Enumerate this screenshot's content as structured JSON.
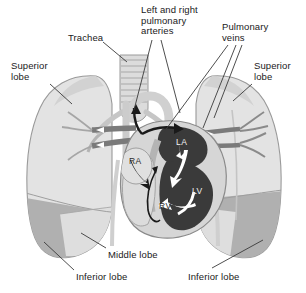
{
  "figure": {
    "background_color": "#ffffff",
    "palette": {
      "lung_light": "#e3e3e3",
      "lung_mid": "#d2d2d2",
      "inferior_lobe_gray": "#b0b0b0",
      "vessel_gray": "#9a9a9a",
      "vessel_dark": "#6f6f6f",
      "heart_chamber_dark": "#3a3a3a",
      "heart_muscle": "#c8c8c8",
      "outline": "#8a8a8a",
      "leader_line": "#3a3a3a",
      "text": "#1a1a1a"
    }
  },
  "labels": [
    {
      "id": "trachea",
      "text": "Trachea",
      "x": 68,
      "y": 33,
      "align": "left"
    },
    {
      "id": "pulmonary-arteries",
      "text": "Left and right\npulmonary\narteries",
      "x": 141,
      "y": 5,
      "align": "left"
    },
    {
      "id": "pulmonary-veins",
      "text": "Pulmonary\nveins",
      "x": 222,
      "y": 22,
      "align": "left"
    },
    {
      "id": "superior-lobe-left",
      "text": "Superior\nlobe",
      "x": 11,
      "y": 61,
      "align": "left"
    },
    {
      "id": "superior-lobe-right",
      "text": "Superior\nlobe",
      "x": 254,
      "y": 61,
      "align": "left"
    },
    {
      "id": "middle-lobe",
      "text": "Middle lobe",
      "x": 108,
      "y": 250,
      "align": "left"
    },
    {
      "id": "inferior-lobe-left",
      "text": "Inferior lobe",
      "x": 76,
      "y": 272,
      "align": "left"
    },
    {
      "id": "inferior-lobe-right",
      "text": "Inferior lobe",
      "x": 188,
      "y": 272,
      "align": "left"
    }
  ],
  "chambers": [
    {
      "id": "right-atrium",
      "text": "RA",
      "x": 129,
      "y": 156,
      "shade": "dark"
    },
    {
      "id": "left-atrium",
      "text": "LA",
      "x": 176,
      "y": 137,
      "shade": "light"
    },
    {
      "id": "left-ventricle",
      "text": "LV",
      "x": 192,
      "y": 186,
      "shade": "light"
    },
    {
      "id": "right-ventricle",
      "text": "RV",
      "x": 159,
      "y": 201,
      "shade": "dark"
    }
  ],
  "leader_lines": [
    {
      "id": "leader-trachea",
      "x1": 103,
      "y1": 42,
      "x2": 127,
      "y2": 62
    },
    {
      "id": "leader-artery-left",
      "x1": 152,
      "y1": 40,
      "x2": 134,
      "y2": 110
    },
    {
      "id": "leader-artery-right",
      "x1": 161,
      "y1": 40,
      "x2": 180,
      "y2": 113
    },
    {
      "id": "leader-vein-left",
      "x1": 228,
      "y1": 45,
      "x2": 164,
      "y2": 132
    },
    {
      "id": "leader-vein-right",
      "x1": 236,
      "y1": 45,
      "x2": 203,
      "y2": 128
    },
    {
      "id": "leader-vein-far-right",
      "x1": 242,
      "y1": 45,
      "x2": 214,
      "y2": 118
    },
    {
      "id": "leader-superior-lobe-left",
      "x1": 50,
      "y1": 84,
      "x2": 72,
      "y2": 104
    },
    {
      "id": "leader-superior-lobe-right",
      "x1": 252,
      "y1": 84,
      "x2": 233,
      "y2": 101
    },
    {
      "id": "leader-middle-lobe",
      "x1": 106,
      "y1": 248,
      "x2": 81,
      "y2": 233
    },
    {
      "id": "leader-inferior-lobe-left",
      "x1": 74,
      "y1": 270,
      "x2": 44,
      "y2": 242
    },
    {
      "id": "leader-inferior-lobe-right",
      "x1": 212,
      "y1": 268,
      "x2": 263,
      "y2": 240
    }
  ]
}
